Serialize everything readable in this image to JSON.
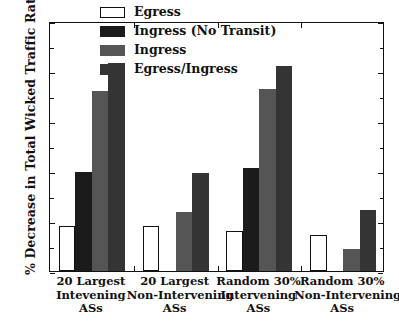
{
  "chart_data": {
    "type": "bar",
    "title": "",
    "xlabel": "",
    "ylabel": "% Decrease in Total Wicked Traffic Rate",
    "ylim": [
      0,
      50
    ],
    "yticks": [
      0,
      10,
      20,
      30,
      40,
      50
    ],
    "ytick_labels": [
      "0",
      "10",
      "20",
      "30",
      "40",
      "50"
    ],
    "y_minor_ticks": [
      5,
      15,
      25,
      35,
      45
    ],
    "grid": false,
    "legend_position": "upper center",
    "categories": [
      "20 Largest Intevening ASs",
      "20 Largest Non-Intervening ASs",
      "Random 30% Intervening ASs",
      "Random 30% Non-Intervening ASs"
    ],
    "category_lines": [
      [
        "20 Largest",
        "Intevening",
        "ASs"
      ],
      [
        "20 Largest",
        "Non-Intervening",
        "ASs"
      ],
      [
        "Random 30%",
        "Intervening",
        "ASs"
      ],
      [
        "Random 30%",
        "Non-Intervening",
        "ASs"
      ]
    ],
    "series": [
      {
        "name": "Egress",
        "color": "#ffffff",
        "values": [
          9.0,
          9.0,
          8.0,
          7.3
        ]
      },
      {
        "name": "Ingress (No Transit)",
        "color": "#1b1b1b",
        "values": [
          19.9,
          0.0,
          20.7,
          0.0
        ]
      },
      {
        "name": "Ingress",
        "color": "#555555",
        "values": [
          36.0,
          11.8,
          36.5,
          4.4
        ]
      },
      {
        "name": "Egress/Ingress",
        "color": "#343434",
        "values": [
          41.6,
          19.6,
          41.0,
          12.2
        ]
      }
    ]
  },
  "axis": {
    "frame_color": "#111111"
  }
}
